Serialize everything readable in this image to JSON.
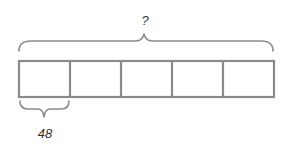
{
  "diagram": {
    "type": "tape-diagram",
    "total_label": "?",
    "segment_label": "48",
    "segment_count": 5,
    "labeled_segment_index": 0,
    "colors": {
      "stroke": "#8a8a8a",
      "text": "#333333",
      "background": "#ffffff"
    }
  }
}
